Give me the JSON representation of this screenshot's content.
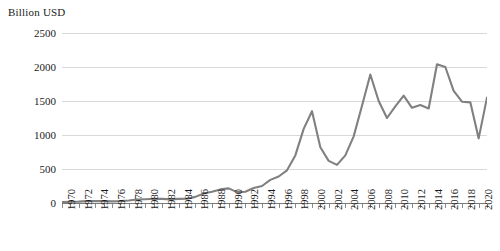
{
  "chart_data": {
    "type": "line",
    "title": "",
    "axis_title": "Billion USD",
    "xlabel": "",
    "ylabel": "Billion USD",
    "ylim": [
      0,
      2500
    ],
    "ytick_labels": [
      "2500",
      "2000",
      "1500",
      "1000",
      "500",
      "0"
    ],
    "ytick_values": [
      2500,
      2000,
      1500,
      1000,
      500,
      0
    ],
    "grid": true,
    "legend": "none",
    "line_color": "#808080",
    "gridline_color": "#d9d9d9",
    "axis_color": "#7a7a7a",
    "x": [
      1970,
      1971,
      1972,
      1973,
      1974,
      1975,
      1976,
      1977,
      1978,
      1979,
      1980,
      1981,
      1982,
      1983,
      1984,
      1985,
      1986,
      1987,
      1988,
      1989,
      1990,
      1991,
      1992,
      1993,
      1994,
      1995,
      1996,
      1997,
      1998,
      1999,
      2000,
      2001,
      2002,
      2003,
      2004,
      2005,
      2006,
      2007,
      2008,
      2009,
      2010,
      2011,
      2012,
      2013,
      2014,
      2015,
      2016,
      2017,
      2018,
      2019,
      2020,
      2021
    ],
    "xtick_labels": [
      "1970",
      "1972",
      "1974",
      "1976",
      "1978",
      "1980",
      "1982",
      "1984",
      "1986",
      "1988",
      "1990",
      "1992",
      "1994",
      "1996",
      "1998",
      "2000",
      "2002",
      "2004",
      "2006",
      "2008",
      "2010",
      "2012",
      "2014",
      "2016",
      "2018",
      "2020"
    ],
    "values": [
      13,
      18,
      20,
      28,
      30,
      28,
      24,
      28,
      36,
      52,
      56,
      62,
      60,
      54,
      60,
      62,
      90,
      140,
      165,
      200,
      215,
      160,
      165,
      220,
      250,
      340,
      390,
      480,
      700,
      1090,
      1350,
      820,
      620,
      560,
      700,
      980,
      1430,
      1890,
      1500,
      1250,
      1420,
      1580,
      1400,
      1440,
      1390,
      2040,
      2000,
      1650,
      1490,
      1480,
      950,
      1550
    ],
    "series_name": "Global FDI inflows",
    "annotations": []
  }
}
